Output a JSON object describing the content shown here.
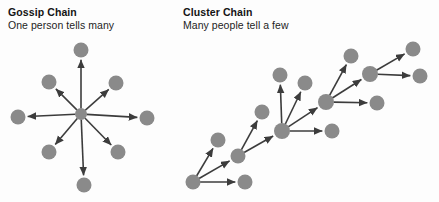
{
  "canvas": {
    "width": 439,
    "height": 202,
    "background": "#fdfdfd"
  },
  "style": {
    "node_color": "#8a8a8a",
    "node_radius": 7.5,
    "hub_radius": 6,
    "edge_color": "#3c3c3c",
    "edge_width": 1.6,
    "arrowhead_color": "#3c3c3c",
    "title_color": "#141414",
    "subtitle_color": "#1d1d1d"
  },
  "panels": [
    {
      "id": "gossip-chain",
      "title": "Gossip Chain",
      "subtitle": "One person tells many",
      "description": "Single central source with arrows radiating outward to eight recipients"
    },
    {
      "id": "cluster-chain",
      "title": "Cluster Chain",
      "subtitle": "Many people tell a few",
      "description": "Diagonal chain of hubs, each passing the message to two or three others"
    }
  ],
  "diagram": {
    "gossip": {
      "hub": {
        "id": "g-hub",
        "x": 81,
        "y": 114,
        "r": 6
      },
      "nodes": [
        {
          "id": "g-n",
          "x": 81,
          "y": 50,
          "r": 7.5
        },
        {
          "id": "g-ne",
          "x": 116,
          "y": 83,
          "r": 7.5
        },
        {
          "id": "g-e",
          "x": 147,
          "y": 118,
          "r": 7.5
        },
        {
          "id": "g-se",
          "x": 118,
          "y": 152,
          "r": 7.5
        },
        {
          "id": "g-s",
          "x": 84,
          "y": 185,
          "r": 7.5
        },
        {
          "id": "g-sw",
          "x": 49,
          "y": 152,
          "r": 7.5
        },
        {
          "id": "g-w",
          "x": 18,
          "y": 117,
          "r": 7.5
        },
        {
          "id": "g-nw",
          "x": 49,
          "y": 82,
          "r": 7.5
        }
      ],
      "edges": [
        {
          "from": "g-hub",
          "to": "g-n"
        },
        {
          "from": "g-hub",
          "to": "g-ne"
        },
        {
          "from": "g-hub",
          "to": "g-e"
        },
        {
          "from": "g-hub",
          "to": "g-se"
        },
        {
          "from": "g-hub",
          "to": "g-s"
        },
        {
          "from": "g-hub",
          "to": "g-sw"
        },
        {
          "from": "g-hub",
          "to": "g-w"
        },
        {
          "from": "g-hub",
          "to": "g-nw"
        }
      ]
    },
    "cluster": {
      "nodes": [
        {
          "id": "c-h1",
          "x": 193,
          "y": 182,
          "r": 7.5
        },
        {
          "id": "c-a1",
          "x": 218,
          "y": 140,
          "r": 7.5
        },
        {
          "id": "c-a2",
          "x": 245,
          "y": 182,
          "r": 7.5
        },
        {
          "id": "c-h2",
          "x": 238,
          "y": 156,
          "r": 7.5
        },
        {
          "id": "c-b1",
          "x": 262,
          "y": 112,
          "r": 7.5
        },
        {
          "id": "c-h3",
          "x": 282,
          "y": 131,
          "r": 8
        },
        {
          "id": "c-c1",
          "x": 280,
          "y": 75,
          "r": 7.5
        },
        {
          "id": "c-c2",
          "x": 305,
          "y": 83,
          "r": 7.5
        },
        {
          "id": "c-c3",
          "x": 332,
          "y": 131,
          "r": 7.5
        },
        {
          "id": "c-h4",
          "x": 326,
          "y": 102,
          "r": 8
        },
        {
          "id": "c-d1",
          "x": 351,
          "y": 56,
          "r": 7.5
        },
        {
          "id": "c-d2",
          "x": 377,
          "y": 103,
          "r": 7.5
        },
        {
          "id": "c-h5",
          "x": 370,
          "y": 74,
          "r": 8
        },
        {
          "id": "c-e1",
          "x": 413,
          "y": 49,
          "r": 7.5
        },
        {
          "id": "c-e2",
          "x": 420,
          "y": 76,
          "r": 7.5
        }
      ],
      "edges": [
        {
          "from": "c-h1",
          "to": "c-a1"
        },
        {
          "from": "c-h1",
          "to": "c-a2"
        },
        {
          "from": "c-h1",
          "to": "c-h2"
        },
        {
          "from": "c-h2",
          "to": "c-b1"
        },
        {
          "from": "c-h2",
          "to": "c-h3"
        },
        {
          "from": "c-h3",
          "to": "c-c1"
        },
        {
          "from": "c-h3",
          "to": "c-c2"
        },
        {
          "from": "c-h3",
          "to": "c-c3"
        },
        {
          "from": "c-h3",
          "to": "c-h4"
        },
        {
          "from": "c-h4",
          "to": "c-d1"
        },
        {
          "from": "c-h4",
          "to": "c-d2"
        },
        {
          "from": "c-h4",
          "to": "c-h5"
        },
        {
          "from": "c-h5",
          "to": "c-e1"
        },
        {
          "from": "c-h5",
          "to": "c-e2"
        }
      ]
    }
  }
}
